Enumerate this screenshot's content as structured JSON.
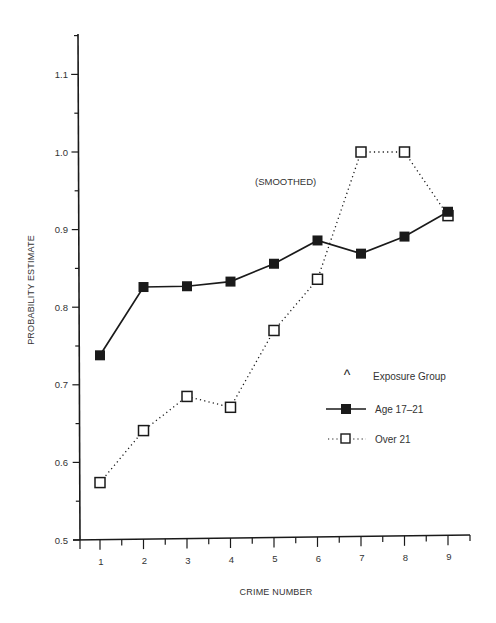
{
  "chart_data": {
    "type": "line",
    "title": "",
    "annotation": "(SMOOTHED)",
    "xlabel": "CRIME NUMBER",
    "ylabel": "PROBABILITY ESTIMATE",
    "x": [
      1,
      2,
      3,
      4,
      5,
      6,
      7,
      8,
      9
    ],
    "x_tick_labels": [
      "1",
      "2",
      "3",
      "4",
      "5",
      "6",
      "7",
      "8",
      "9"
    ],
    "y_tick_labels": [
      "0.5",
      "0.6",
      "0.7",
      "0.8",
      "0.9",
      "1.0",
      "1.1"
    ],
    "ylim": [
      0.5,
      1.15
    ],
    "grid": false,
    "legend_position": "right-center",
    "legend_title": "Exposure Group",
    "series": [
      {
        "name": "Age 17–21",
        "style": "solid line, filled square markers",
        "values": [
          0.738,
          0.826,
          0.827,
          0.833,
          0.856,
          0.886,
          0.869,
          0.891,
          0.923
        ]
      },
      {
        "name": "Over 21",
        "style": "dotted line, open square markers",
        "values": [
          0.574,
          0.641,
          0.685,
          0.671,
          0.77,
          0.836,
          1.0,
          1.0,
          0.918
        ]
      }
    ]
  },
  "legend": {
    "title_symbol": "^",
    "title": "Exposure Group",
    "items": [
      {
        "label": "Age 17–21"
      },
      {
        "label": "Over 21"
      }
    ]
  },
  "colors": {
    "ink": "#1a1a1a",
    "text": "#333333",
    "background": "#ffffff"
  }
}
